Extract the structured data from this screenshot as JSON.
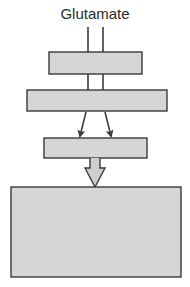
{
  "diagram": {
    "title": "Glutamate",
    "colors": {
      "stroke": "#3a3a3a",
      "box_fill": "#d6d6d6",
      "arrow_fill": "#cfcfcf",
      "background": "#ffffff"
    },
    "boxes": [
      {
        "id": "box-1",
        "label": "",
        "x": 49,
        "y": 52,
        "w": 93,
        "h": 22
      },
      {
        "id": "box-2",
        "label": "",
        "x": 27,
        "y": 90,
        "w": 140,
        "h": 21
      },
      {
        "id": "box-3",
        "label": "",
        "x": 44,
        "y": 138,
        "w": 103,
        "h": 20
      },
      {
        "id": "box-4",
        "label": "",
        "x": 11,
        "y": 187,
        "w": 170,
        "h": 90
      }
    ],
    "connectors": [
      {
        "id": "glutamate-line-left",
        "from": "label",
        "to": "box-1"
      },
      {
        "id": "glutamate-line-right",
        "from": "label",
        "to": "box-1"
      },
      {
        "id": "box1-box2-line-left",
        "from": "box-1",
        "to": "box-2"
      },
      {
        "id": "box1-box2-line-right",
        "from": "box-1",
        "to": "box-2"
      },
      {
        "id": "arrow-left",
        "from": "box-2",
        "to": "box-3"
      },
      {
        "id": "arrow-right",
        "from": "box-2",
        "to": "box-3"
      },
      {
        "id": "hollow-arrow",
        "from": "box-3",
        "to": "box-4"
      }
    ]
  }
}
